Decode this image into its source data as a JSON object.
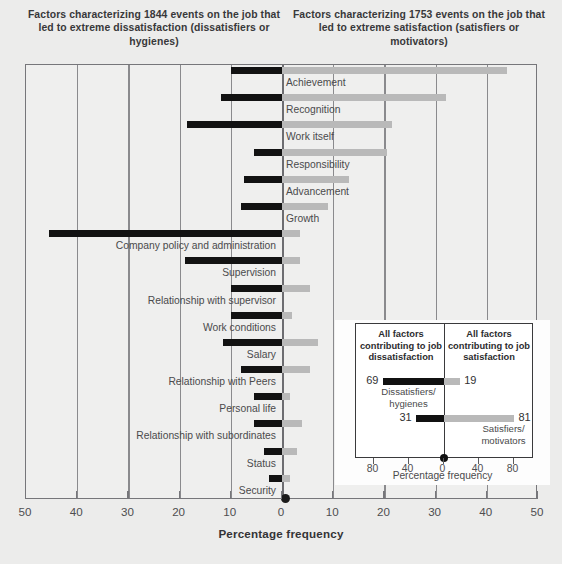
{
  "headers": {
    "left": "Factors characterizing 1844 events on the job that led to extreme dissatisfaction (dissatisfiers or hygienes)",
    "right": "Factors characterizing 1753 events on the job that led to extreme satisfaction (satisfiers or motivators)"
  },
  "axis": {
    "title": "Percentage frequency",
    "ticks": [
      50,
      40,
      30,
      20,
      10,
      0,
      10,
      20,
      30,
      40,
      50
    ],
    "xlim": [
      -50,
      50
    ]
  },
  "inset": {
    "header_left": "All factors contributing to job dissatisfaction",
    "header_right": "All factors contributing to job satisfaction",
    "axis_title": "Percentage frequency",
    "ticks": [
      80,
      40,
      0,
      40,
      80
    ],
    "xlim": [
      -100,
      100
    ],
    "rows": [
      {
        "caption": "Dissatisfiers/ hygienes",
        "neg": 69,
        "pos": 19,
        "neg_label": "69",
        "pos_label": "19"
      },
      {
        "caption": "Satisfiers/ motivators",
        "neg": 31,
        "pos": 81,
        "neg_label": "31",
        "pos_label": "81"
      }
    ]
  },
  "chart_data": {
    "type": "bar",
    "xlabel": "Percentage frequency",
    "ylabel": "",
    "xlim": [
      -50,
      50
    ],
    "grid": true,
    "legend": [
      "Dissatisfiers or hygienes (black, left)",
      "Satisfiers or motivators (grey, right)"
    ],
    "series": [
      {
        "name": "Dissatisfaction (hygienes)",
        "color": "#121212",
        "direction": "left"
      },
      {
        "name": "Satisfaction (motivators)",
        "color": "#b9b9b9",
        "direction": "right"
      }
    ],
    "categories": [
      "Achievement",
      "Recognition",
      "Work itself",
      "Responsibility",
      "Advancement",
      "Growth",
      "Company policy and administration",
      "Supervision",
      "Relationship with supervisor",
      "Work conditions",
      "Salary",
      "Relationship with Peers",
      "Personal life",
      "Relationship with subordinates",
      "Status",
      "Security"
    ],
    "rows": [
      {
        "label": "Achievement",
        "side": "right",
        "dissatisfaction": 10.0,
        "satisfaction": 44.0
      },
      {
        "label": "Recognition",
        "side": "right",
        "dissatisfaction": 12.0,
        "satisfaction": 32.0
      },
      {
        "label": "Work itself",
        "side": "right",
        "dissatisfaction": 18.5,
        "satisfaction": 21.5
      },
      {
        "label": "Responsibility",
        "side": "right",
        "dissatisfaction": 5.5,
        "satisfaction": 20.5
      },
      {
        "label": "Advancement",
        "side": "right",
        "dissatisfaction": 7.5,
        "satisfaction": 13.0
      },
      {
        "label": "Growth",
        "side": "right",
        "dissatisfaction": 8.0,
        "satisfaction": 9.0
      },
      {
        "label": "Company policy and administration",
        "side": "left",
        "dissatisfaction": 45.5,
        "satisfaction": 3.5
      },
      {
        "label": "Supervision",
        "side": "left",
        "dissatisfaction": 19.0,
        "satisfaction": 3.5
      },
      {
        "label": "Relationship with supervisor",
        "side": "left",
        "dissatisfaction": 10.0,
        "satisfaction": 5.5
      },
      {
        "label": "Work conditions",
        "side": "left",
        "dissatisfaction": 10.0,
        "satisfaction": 2.0
      },
      {
        "label": "Salary",
        "side": "left",
        "dissatisfaction": 11.5,
        "satisfaction": 7.0
      },
      {
        "label": "Relationship with Peers",
        "side": "left",
        "dissatisfaction": 8.0,
        "satisfaction": 5.5
      },
      {
        "label": "Personal life",
        "side": "left",
        "dissatisfaction": 5.5,
        "satisfaction": 1.5
      },
      {
        "label": "Relationship with subordinates",
        "side": "left",
        "dissatisfaction": 5.5,
        "satisfaction": 4.0
      },
      {
        "label": "Status",
        "side": "left",
        "dissatisfaction": 3.5,
        "satisfaction": 3.0
      },
      {
        "label": "Security",
        "side": "left",
        "dissatisfaction": 2.5,
        "satisfaction": 1.5
      }
    ]
  },
  "colors": {
    "dissatisfaction_bar": "#121212",
    "satisfaction_bar": "#b9b9b9",
    "background": "#ececeb",
    "axis": "#76767a"
  }
}
